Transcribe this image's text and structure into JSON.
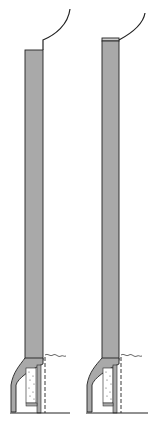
{
  "figure": {
    "title": "",
    "panels": [
      {
        "id": "left",
        "description": "Vertical gray strip with curved top lead and bottom bend into bracket with dotted fill"
      },
      {
        "id": "right",
        "description": "Vertical gray strip with capped top, curved lead and bottom bend into bracket with dotted fill"
      }
    ]
  },
  "colors": {
    "strip_fill": "#a9a9a9",
    "outline": "#222222",
    "background": "#ffffff",
    "dot": "#555555"
  }
}
